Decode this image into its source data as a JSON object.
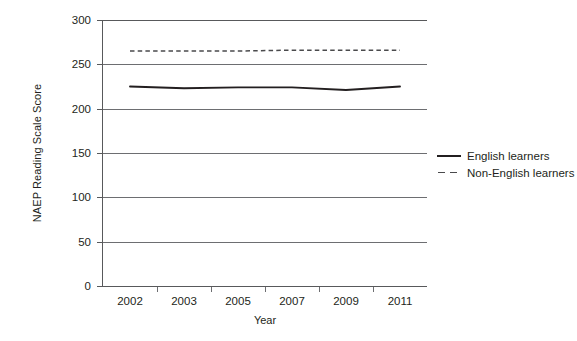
{
  "chart_data": {
    "type": "line",
    "title": "",
    "xlabel": "Year",
    "ylabel": "NAEP Reading Scale Score",
    "categories": [
      "2002",
      "2003",
      "2005",
      "2007",
      "2009",
      "2011"
    ],
    "ylim": [
      0,
      300
    ],
    "yticks": [
      0,
      50,
      100,
      150,
      200,
      250,
      300
    ],
    "ytick_labels": [
      "0",
      "50",
      "100",
      "150",
      "200",
      "250",
      "300"
    ],
    "grid": true,
    "legend_position": "right",
    "series": [
      {
        "name": "English learners",
        "style": "solid",
        "color": "#231f20",
        "values": [
          225,
          223,
          224,
          224,
          221,
          225
        ]
      },
      {
        "name": "Non-English learners",
        "style": "dashed",
        "color": "#4a4a4c",
        "values": [
          265,
          265,
          265,
          266,
          266,
          266
        ]
      }
    ]
  },
  "legend": {
    "items": [
      {
        "label": "English learners"
      },
      {
        "label": "Non-English learners"
      }
    ]
  },
  "axes": {
    "y_title": "NAEP Reading Scale Score",
    "x_title": "Year"
  }
}
